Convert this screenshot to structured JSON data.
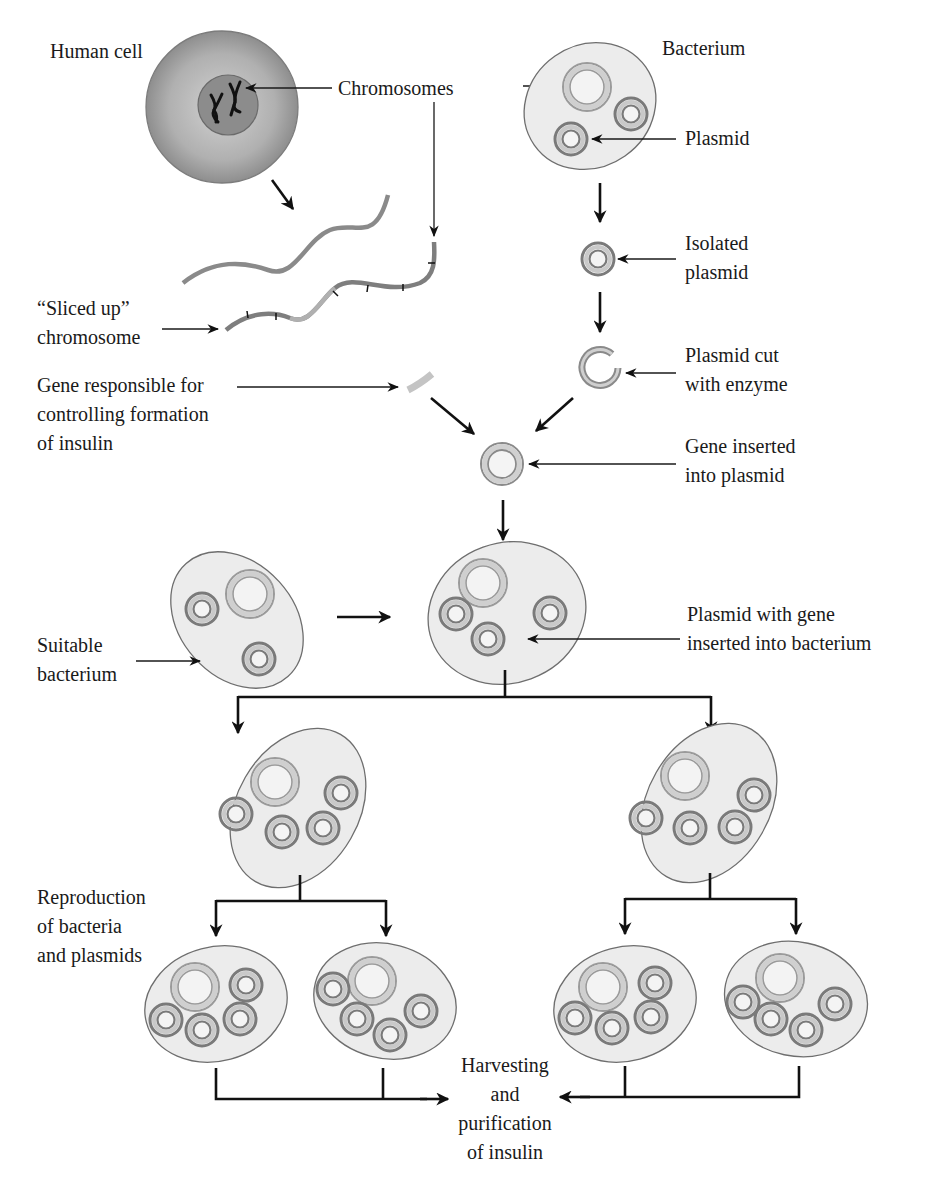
{
  "labels": {
    "human_cell": "Human cell",
    "chromosomes": "Chromosomes",
    "bacterium": "Bacterium",
    "plasmid": "Plasmid",
    "isolated_plasmid": [
      "Isolated",
      "plasmid"
    ],
    "sliced_chromosome": [
      "“Sliced up”",
      "chromosome"
    ],
    "gene_responsible": [
      "Gene responsible for",
      "controlling formation",
      "of insulin"
    ],
    "plasmid_cut": [
      "Plasmid cut",
      "with enzyme"
    ],
    "gene_inserted": [
      "Gene inserted",
      "into plasmid"
    ],
    "suitable_bacterium": [
      "Suitable",
      "bacterium"
    ],
    "plasmid_with_gene": [
      "Plasmid with gene",
      "inserted into bacterium"
    ],
    "reproduction": [
      "Reproduction",
      "of bacteria",
      "and plasmids"
    ],
    "harvesting": [
      "Harvesting",
      "and",
      "purification",
      "of insulin"
    ]
  },
  "colors": {
    "cell_outer": "#9a9a9a",
    "cell_inner": "#8a8a8a",
    "bacterium_fill": "#ececec",
    "bacterium_stroke": "#6e6e6e",
    "plasmid_dark": "#7a7a7a",
    "plasmid_light": "#c8c8c8",
    "chromosome_big": "#b8b8b8",
    "gene_fragment": "#c4c4c4",
    "arrow": "#111111"
  }
}
